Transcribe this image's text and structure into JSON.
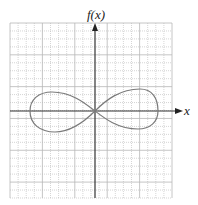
{
  "chart_data": {
    "type": "line",
    "title": "",
    "xlabel": "x",
    "ylabel": "f(x)",
    "grid": true,
    "legend": null,
    "xlim": [
      -10,
      10
    ],
    "ylim": [
      -11,
      11
    ],
    "grid_cells": {
      "x": 20,
      "y": 22
    },
    "series": [
      {
        "name": "curve",
        "shape": "lemniscate",
        "points_approx": [
          {
            "x": -8,
            "y": 0
          },
          {
            "x": -5,
            "y": 2.5
          },
          {
            "x": -2,
            "y": 1.5
          },
          {
            "x": 0,
            "y": 0
          },
          {
            "x": 2,
            "y": -1.5
          },
          {
            "x": 5,
            "y": -2.5
          },
          {
            "x": 8,
            "y": 0
          },
          {
            "x": 5,
            "y": 2.8
          },
          {
            "x": 2,
            "y": 1.5
          },
          {
            "x": 0,
            "y": 0
          },
          {
            "x": -2,
            "y": -1.5
          },
          {
            "x": -5,
            "y": -2.8
          },
          {
            "x": -8,
            "y": 0
          }
        ]
      }
    ]
  },
  "labels": {
    "y_axis": "f(x)",
    "x_axis": "x"
  },
  "colors": {
    "grid": "#b8b8b8",
    "axis": "#333333",
    "curve": "#7a7a7a"
  }
}
